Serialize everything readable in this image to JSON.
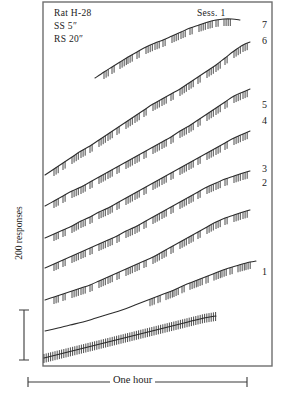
{
  "figure": {
    "type": "cumulative-response-record",
    "background": "#ffffff",
    "ink_color": "#2b2b2b",
    "frame": {
      "x": 43,
      "y": 2,
      "width": 229,
      "height": 364,
      "border_color": "#6e6e6e"
    }
  },
  "header": {
    "subject_label": "Rat H-28",
    "ss_label": "SS 5″",
    "rs_label": "RS 20″",
    "session_label": "Sess. 1"
  },
  "axes": {
    "y_label": "200 responses",
    "x_label": "One hour",
    "y_scalebar": {
      "x": 24,
      "y_top": 310,
      "y_bottom": 360,
      "cap_half_width": 5
    },
    "x_scalebar": {
      "x_left": 28,
      "x_right": 247,
      "y": 382,
      "cap_half_height": 5
    }
  },
  "curve_labels": [
    {
      "text": "7",
      "x": 262,
      "y": 18
    },
    {
      "text": "6",
      "x": 262,
      "y": 34
    },
    {
      "text": "5",
      "x": 262,
      "y": 98
    },
    {
      "text": "4",
      "x": 262,
      "y": 114
    },
    {
      "text": "3",
      "x": 262,
      "y": 162
    },
    {
      "text": "2",
      "x": 262,
      "y": 176
    },
    {
      "text": "1",
      "x": 262,
      "y": 265
    }
  ],
  "chart_data": {
    "type": "line",
    "xlabel": "One hour",
    "ylabel": "200 responses",
    "grid": false,
    "legend": "right-edge curve numbers 1-7",
    "annotations": [
      "Rat H-28",
      "SS 5″",
      "RS 20″",
      "Sess. 1"
    ],
    "series": [
      {
        "name": "7",
        "points": [
          [
            95,
            78
          ],
          [
            104,
            72
          ],
          [
            112,
            67
          ],
          [
            120,
            62
          ],
          [
            128,
            57
          ],
          [
            137,
            52
          ],
          [
            146,
            47
          ],
          [
            155,
            43
          ],
          [
            163,
            40
          ],
          [
            172,
            36
          ],
          [
            181,
            32
          ],
          [
            190,
            28
          ],
          [
            199,
            25
          ],
          [
            208,
            22
          ],
          [
            216,
            20
          ],
          [
            224,
            19
          ],
          [
            232,
            19
          ],
          [
            240,
            20
          ]
        ],
        "ticks_x": [
          104,
          112,
          120,
          128,
          137,
          146,
          155,
          163,
          172,
          181,
          190,
          199,
          208,
          216,
          224
        ],
        "tick_len": 7
      },
      {
        "name": "6",
        "points": [
          [
            45,
            175
          ],
          [
            54,
            169
          ],
          [
            63,
            163
          ],
          [
            72,
            157
          ],
          [
            81,
            151
          ],
          [
            90,
            146
          ],
          [
            99,
            140
          ],
          [
            108,
            134
          ],
          [
            117,
            128
          ],
          [
            126,
            122
          ],
          [
            135,
            116
          ],
          [
            144,
            110
          ],
          [
            153,
            104
          ],
          [
            162,
            99
          ],
          [
            171,
            94
          ],
          [
            180,
            89
          ],
          [
            189,
            83
          ],
          [
            198,
            77
          ],
          [
            207,
            71
          ],
          [
            216,
            65
          ],
          [
            225,
            58
          ],
          [
            234,
            51
          ],
          [
            243,
            45
          ],
          [
            250,
            42
          ]
        ],
        "ticks_x": [
          54,
          63,
          72,
          81,
          90,
          99,
          108,
          117,
          126,
          135,
          144,
          153,
          162,
          171,
          180,
          189,
          198,
          207,
          216,
          225,
          234,
          243
        ],
        "tick_len": 7
      },
      {
        "name": "5",
        "points": [
          [
            45,
            206
          ],
          [
            54,
            201
          ],
          [
            63,
            196
          ],
          [
            72,
            191
          ],
          [
            81,
            187
          ],
          [
            90,
            182
          ],
          [
            99,
            177
          ],
          [
            108,
            172
          ],
          [
            117,
            167
          ],
          [
            126,
            162
          ],
          [
            135,
            157
          ],
          [
            144,
            152
          ],
          [
            153,
            147
          ],
          [
            162,
            142
          ],
          [
            171,
            137
          ],
          [
            180,
            131
          ],
          [
            189,
            126
          ],
          [
            198,
            120
          ],
          [
            207,
            114
          ],
          [
            216,
            108
          ],
          [
            225,
            102
          ],
          [
            234,
            96
          ],
          [
            243,
            92
          ],
          [
            250,
            89
          ]
        ],
        "ticks_x": [
          54,
          63,
          72,
          81,
          90,
          99,
          108,
          117,
          126,
          135,
          144,
          153,
          162,
          171,
          180,
          189,
          198,
          207,
          216,
          225,
          234,
          243
        ],
        "tick_len": 7
      },
      {
        "name": "4",
        "points": [
          [
            45,
            238
          ],
          [
            54,
            234
          ],
          [
            63,
            230
          ],
          [
            72,
            226
          ],
          [
            81,
            221
          ],
          [
            90,
            217
          ],
          [
            99,
            212
          ],
          [
            108,
            208
          ],
          [
            117,
            203
          ],
          [
            126,
            198
          ],
          [
            135,
            193
          ],
          [
            144,
            188
          ],
          [
            153,
            183
          ],
          [
            162,
            178
          ],
          [
            171,
            173
          ],
          [
            180,
            168
          ],
          [
            189,
            163
          ],
          [
            198,
            158
          ],
          [
            207,
            153
          ],
          [
            216,
            148
          ],
          [
            225,
            143
          ],
          [
            234,
            138
          ],
          [
            243,
            134
          ],
          [
            250,
            131
          ]
        ],
        "ticks_x": [
          54,
          63,
          72,
          81,
          90,
          99,
          108,
          117,
          126,
          135,
          144,
          153,
          162,
          171,
          180,
          189,
          198,
          207,
          216,
          225,
          234,
          243
        ],
        "tick_len": 7
      },
      {
        "name": "3",
        "points": [
          [
            45,
            268
          ],
          [
            54,
            264
          ],
          [
            63,
            260
          ],
          [
            72,
            256
          ],
          [
            81,
            252
          ],
          [
            90,
            248
          ],
          [
            99,
            244
          ],
          [
            108,
            240
          ],
          [
            117,
            236
          ],
          [
            126,
            231
          ],
          [
            135,
            227
          ],
          [
            144,
            222
          ],
          [
            153,
            217
          ],
          [
            162,
            212
          ],
          [
            171,
            207
          ],
          [
            180,
            202
          ],
          [
            189,
            197
          ],
          [
            198,
            192
          ],
          [
            207,
            187
          ],
          [
            216,
            183
          ],
          [
            225,
            179
          ],
          [
            234,
            176
          ],
          [
            243,
            173
          ],
          [
            250,
            171
          ]
        ],
        "ticks_x": [
          54,
          63,
          72,
          81,
          90,
          99,
          108,
          117,
          126,
          135,
          144,
          153,
          162,
          171,
          180,
          189,
          198,
          207,
          216,
          225,
          234,
          243
        ],
        "tick_len": 7
      },
      {
        "name": "2",
        "points": [
          [
            45,
            300
          ],
          [
            54,
            297
          ],
          [
            63,
            294
          ],
          [
            72,
            291
          ],
          [
            81,
            288
          ],
          [
            90,
            285
          ],
          [
            99,
            281
          ],
          [
            108,
            277
          ],
          [
            117,
            273
          ],
          [
            126,
            269
          ],
          [
            135,
            265
          ],
          [
            144,
            261
          ],
          [
            153,
            257
          ],
          [
            162,
            252
          ],
          [
            171,
            247
          ],
          [
            180,
            242
          ],
          [
            189,
            237
          ],
          [
            198,
            232
          ],
          [
            207,
            227
          ],
          [
            216,
            222
          ],
          [
            225,
            218
          ],
          [
            234,
            215
          ],
          [
            243,
            212
          ],
          [
            250,
            210
          ]
        ],
        "ticks_x": [
          54,
          63,
          72,
          81,
          90,
          99,
          108,
          117,
          126,
          135,
          144,
          153,
          162,
          171,
          180,
          189,
          198,
          207,
          216,
          225,
          234,
          243
        ],
        "tick_len": 7
      },
      {
        "name": "1",
        "points": [
          [
            45,
            331
          ],
          [
            58,
            328
          ],
          [
            70,
            325
          ],
          [
            83,
            322
          ],
          [
            96,
            318
          ],
          [
            109,
            314
          ],
          [
            122,
            310
          ],
          [
            135,
            305
          ],
          [
            148,
            300
          ],
          [
            161,
            295
          ],
          [
            174,
            290
          ],
          [
            187,
            284
          ],
          [
            200,
            279
          ],
          [
            213,
            274
          ],
          [
            226,
            269
          ],
          [
            239,
            265
          ],
          [
            250,
            262
          ],
          [
            256,
            261
          ]
        ],
        "ticks_x": [
          150,
          158,
          166,
          174,
          182,
          190,
          198,
          206,
          214,
          222,
          230,
          238,
          246
        ],
        "tick_len": 7
      },
      {
        "name": "1-base-dense",
        "points": [
          [
            44,
            358
          ],
          [
            60,
            354
          ],
          [
            76,
            350
          ],
          [
            92,
            346
          ],
          [
            108,
            342
          ],
          [
            124,
            338
          ],
          [
            140,
            334
          ],
          [
            156,
            330
          ],
          [
            172,
            326
          ],
          [
            188,
            322
          ],
          [
            204,
            318
          ],
          [
            216,
            316
          ]
        ],
        "dense_ticks": true,
        "dense_step": 2.2,
        "tick_len": 9
      }
    ]
  }
}
